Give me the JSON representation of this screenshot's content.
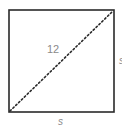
{
  "figure": {
    "shape": "square",
    "diagonal": {
      "label": "12",
      "style": "dotted",
      "from": "bottom-left",
      "to": "top-right"
    },
    "side_labels": {
      "bottom": "s",
      "right": "s"
    },
    "colors": {
      "stroke": "#2a2a2a",
      "diagonal": "#2a2a2a",
      "label": "#8a8a8a",
      "background": "#ffffff"
    }
  }
}
